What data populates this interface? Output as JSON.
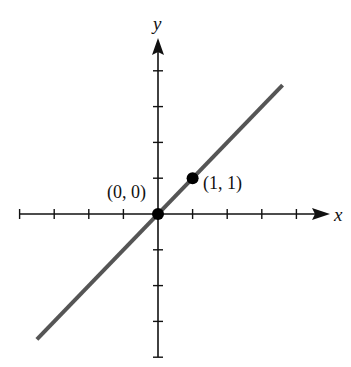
{
  "chart_data": {
    "type": "line",
    "title": "",
    "xlabel": "x",
    "ylabel": "y",
    "xlim": [
      -4,
      4
    ],
    "ylim": [
      -4,
      4
    ],
    "grid": false,
    "x_ticks": [
      -4,
      -3,
      -2,
      -1,
      1,
      2,
      3,
      4
    ],
    "y_ticks": [
      -4,
      -3,
      -2,
      -1,
      1,
      2,
      3,
      4
    ],
    "series": [
      {
        "name": "y = x",
        "x": [
          -3.5,
          3.6
        ],
        "y": [
          -3.5,
          3.6
        ],
        "color": "#555555"
      }
    ],
    "points": [
      {
        "x": 0,
        "y": 0,
        "label": "(0, 0)"
      },
      {
        "x": 1,
        "y": 1,
        "label": "(1, 1)"
      }
    ]
  },
  "labels": {
    "x_axis": "x",
    "y_axis": "y",
    "origin": "(0, 0)",
    "point": "(1, 1)"
  }
}
